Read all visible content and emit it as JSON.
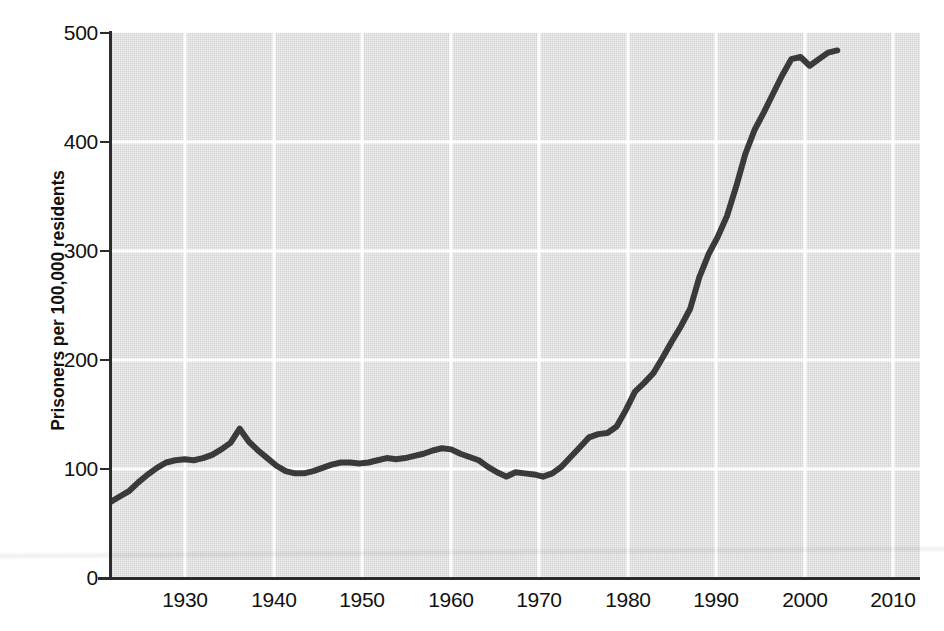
{
  "chart_data": {
    "type": "line",
    "title": "",
    "xlabel": "",
    "ylabel": "Prisoners per 100,000 residents",
    "xlim": [
      1925,
      2013
    ],
    "ylim": [
      0,
      500
    ],
    "grid": true,
    "legend": "none",
    "line_color": "#3a3a3a",
    "plot_background": "#dedede",
    "gridline_color": "#ffffff",
    "axis_color": "#2b2b2b",
    "x_ticks": [
      1930,
      1940,
      1950,
      1960,
      1970,
      1980,
      1990,
      2000,
      2010
    ],
    "x_tick_labels": [
      "1930",
      "1940",
      "1950",
      "1960",
      "1970",
      "1980",
      "1990",
      "2000",
      "2010"
    ],
    "y_ticks": [
      0,
      100,
      200,
      300,
      400,
      500
    ],
    "y_tick_labels": [
      "0",
      "100",
      "200",
      "300",
      "400",
      "500"
    ],
    "series": [
      {
        "name": "Prisoners per 100,000 residents",
        "x": [
          1925,
          1926,
          1927,
          1928,
          1929,
          1930,
          1931,
          1932,
          1933,
          1934,
          1935,
          1936,
          1937,
          1938,
          1939,
          1940,
          1941,
          1942,
          1943,
          1944,
          1945,
          1946,
          1947,
          1948,
          1949,
          1950,
          1951,
          1952,
          1953,
          1954,
          1955,
          1956,
          1957,
          1958,
          1959,
          1960,
          1961,
          1962,
          1963,
          1964,
          1965,
          1966,
          1967,
          1968,
          1969,
          1970,
          1971,
          1972,
          1973,
          1974,
          1975,
          1976,
          1977,
          1978,
          1979,
          1980,
          1981,
          1982,
          1983,
          1984,
          1985,
          1986,
          1987,
          1988,
          1989,
          1990,
          1991,
          1992,
          1993,
          1994,
          1995,
          1996,
          1997,
          1998,
          1999,
          2000,
          2001,
          2002,
          2003,
          2004
        ],
        "values": [
          70,
          75,
          80,
          88,
          95,
          101,
          106,
          108,
          109,
          108,
          110,
          113,
          118,
          124,
          137,
          125,
          117,
          110,
          103,
          98,
          96,
          96,
          98,
          101,
          104,
          106,
          106,
          105,
          106,
          108,
          110,
          109,
          110,
          112,
          114,
          117,
          119,
          118,
          114,
          111,
          108,
          102,
          97,
          93,
          97,
          96,
          95,
          93,
          96,
          102,
          111,
          120,
          129,
          132,
          133,
          139,
          154,
          171,
          179,
          188,
          202,
          217,
          231,
          247,
          276,
          297,
          313,
          332,
          359,
          389,
          411,
          427,
          444,
          461,
          476,
          478,
          470,
          476,
          482,
          484
        ]
      }
    ],
    "annotations": []
  },
  "axis": {
    "y_title": "Prisoners per 100,000 residents"
  },
  "caption": {
    "text": ""
  }
}
